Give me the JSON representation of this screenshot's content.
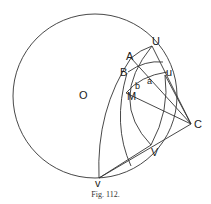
{
  "figure": {
    "caption": "Fig. 112.",
    "labels": {
      "O": "O",
      "U": "U",
      "A": "A",
      "B": "B",
      "u": "u",
      "a": "a",
      "b": "b",
      "M": "M",
      "C": "C",
      "V": "V",
      "v": "v"
    },
    "stroke_color": "#333333"
  }
}
